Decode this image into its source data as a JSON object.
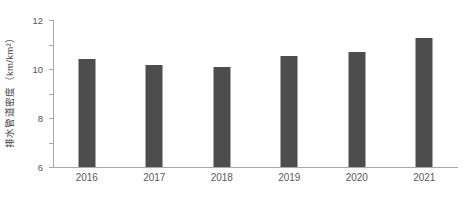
{
  "chart_data": {
    "type": "bar",
    "title": "",
    "xlabel": "",
    "ylabel": "排水管道密度（km/km²）",
    "categories": [
      "2016",
      "2017",
      "2018",
      "2019",
      "2020",
      "2021"
    ],
    "values": [
      8.85,
      8.35,
      8.2,
      9.05,
      9.4,
      10.5
    ],
    "yticks": [
      "0",
      "2",
      "4",
      "6",
      "8",
      "10",
      "12"
    ],
    "ytick_values": [
      0,
      2,
      4,
      6,
      8,
      10,
      12
    ],
    "ylim": [
      0,
      12
    ],
    "grid": false,
    "legend": "none",
    "series": [
      {
        "name": "排水管道密度",
        "values": [
          8.85,
          8.35,
          8.2,
          9.05,
          9.4,
          10.5
        ]
      }
    ],
    "bar_color": "#4d4d4d",
    "axis_color": "#a9a9a9",
    "background_color": "#ffffff"
  }
}
